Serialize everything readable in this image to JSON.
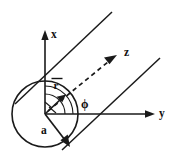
{
  "figure": {
    "background_color": "#ffffff",
    "ink_color": "#1a1a1a",
    "width": 173,
    "height": 162
  },
  "axes": {
    "x": {
      "label": "x",
      "direction": "vertical up",
      "style": "solid arrow",
      "label_x": 51,
      "label_y": 38
    },
    "y": {
      "label": "y",
      "direction": "horizontal right",
      "style": "solid arrow",
      "label_x": 159,
      "label_y": 117
    },
    "z": {
      "label": "z",
      "direction": "diagonal up-right",
      "style": "dashed arrow",
      "label_x": 124,
      "label_y": 56
    }
  },
  "labels": {
    "radius_vector": "r",
    "radius_vector_has_overbar": true,
    "cylinder_radius": "a",
    "azimuth_angle": "ϕ"
  },
  "geometry": {
    "origin": {
      "x": 45,
      "y": 114
    },
    "circle": {
      "cx": 45,
      "cy": 114,
      "r": 33
    },
    "cylinder_lines": 2,
    "cylinder_line_angle_deg": 45
  }
}
